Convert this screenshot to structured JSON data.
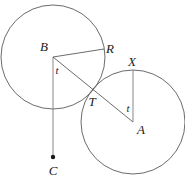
{
  "figure": {
    "kind": "geometry-diagram",
    "width": 185,
    "height": 180,
    "background_color": "#ffffff",
    "stroke_color": "#5a5a5a",
    "label_color": "#1a1a1a",
    "stroke_width": 0.9
  },
  "circles": [
    {
      "id": "circle-b",
      "label": "B",
      "cx": 53,
      "cy": 57,
      "r": 52
    },
    {
      "id": "circle-a",
      "label": "A",
      "cx": 133,
      "cy": 122,
      "r": 52
    }
  ],
  "points": [
    {
      "id": "point-b",
      "label": "B",
      "x": 53,
      "y": 57,
      "label_x": 44,
      "label_y": 46,
      "dot": false
    },
    {
      "id": "point-r",
      "label": "R",
      "x": 104,
      "y": 49,
      "label_x": 110,
      "label_y": 48,
      "dot": false
    },
    {
      "id": "point-x",
      "label": "X",
      "x": 133,
      "y": 70,
      "label_x": 132,
      "label_y": 61,
      "dot": false
    },
    {
      "id": "point-t",
      "label": "T",
      "x": 91,
      "y": 93,
      "label_x": 92,
      "label_y": 101,
      "dot": false
    },
    {
      "id": "point-a",
      "label": "A",
      "x": 133,
      "y": 122,
      "label_x": 141,
      "label_y": 129,
      "dot": false
    },
    {
      "id": "point-c",
      "label": "C",
      "x": 53,
      "y": 157,
      "label_x": 53,
      "label_y": 170,
      "dot": true
    }
  ],
  "segment_labels": [
    {
      "id": "label-t-left",
      "label": "t",
      "x": 57,
      "y": 70
    },
    {
      "id": "label-t-right",
      "label": "t",
      "x": 128,
      "y": 108
    }
  ],
  "segments": [
    {
      "id": "segment-b-r",
      "from": "B",
      "to": "R",
      "x1": 53,
      "y1": 57,
      "x2": 104,
      "y2": 49
    },
    {
      "id": "segment-b-c",
      "from": "B",
      "to": "C",
      "x1": 53,
      "y1": 57,
      "x2": 53,
      "y2": 157
    },
    {
      "id": "segment-b-a",
      "from": "B",
      "to": "A",
      "x1": 53,
      "y1": 57,
      "x2": 133,
      "y2": 122
    },
    {
      "id": "segment-x-a",
      "from": "X",
      "to": "A",
      "x1": 133,
      "y1": 70,
      "x2": 133,
      "y2": 122
    }
  ]
}
